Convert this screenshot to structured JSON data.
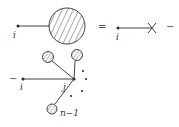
{
  "diagram": {
    "top_equation": {
      "lhs_external_label": "i",
      "equals": "=",
      "rhs_external_label": "i",
      "trailing_operator": "−"
    },
    "bottom_term": {
      "leading_operator": "−",
      "external_label": "i",
      "internal_label": "j",
      "last_leg_label": "n−1"
    },
    "colors": {
      "line": "#444444",
      "hatch": "#555555"
    }
  }
}
